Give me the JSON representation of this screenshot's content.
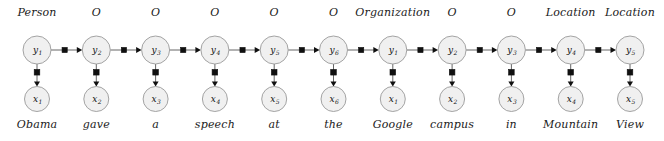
{
  "figure": {
    "type": "factor-graph-diagram",
    "colors": {
      "node_fill": "#f0f0f0",
      "node_stroke": "#9a9a9a",
      "edge": "#666666",
      "factor": "#101010",
      "text": "#1a1a1a",
      "background": "#ffffff"
    }
  },
  "layout": {
    "width": 664,
    "height": 141,
    "first_node_x": 37,
    "node_spacing": 59.3,
    "y_row_cy": 50,
    "x_row_cy": 99,
    "y_node_radius": 14,
    "x_node_radius": 12.5
  },
  "columns": [
    {
      "tag": "Person",
      "word": "Obama",
      "y_label": "y",
      "y_sub": "1",
      "x_label": "x",
      "x_sub": "1"
    },
    {
      "tag": "O",
      "word": "gave",
      "y_label": "y",
      "y_sub": "2",
      "x_label": "x",
      "x_sub": "2"
    },
    {
      "tag": "O",
      "word": "a",
      "y_label": "y",
      "y_sub": "3",
      "x_label": "x",
      "x_sub": "3"
    },
    {
      "tag": "O",
      "word": "speech",
      "y_label": "y",
      "y_sub": "4",
      "x_label": "x",
      "x_sub": "4"
    },
    {
      "tag": "O",
      "word": "at",
      "y_label": "y",
      "y_sub": "5",
      "x_label": "x",
      "x_sub": "5"
    },
    {
      "tag": "O",
      "word": "the",
      "y_label": "y",
      "y_sub": "6",
      "x_label": "x",
      "x_sub": "6"
    },
    {
      "tag": "Organization",
      "word": "Google",
      "y_label": "y",
      "y_sub": "1",
      "x_label": "x",
      "x_sub": "1"
    },
    {
      "tag": "O",
      "word": "campus",
      "y_label": "y",
      "y_sub": "2",
      "x_label": "x",
      "x_sub": "2"
    },
    {
      "tag": "O",
      "word": "in",
      "y_label": "y",
      "y_sub": "3",
      "x_label": "x",
      "x_sub": "3"
    },
    {
      "tag": "Location",
      "word": "Mountain",
      "y_label": "y",
      "y_sub": "4",
      "x_label": "x",
      "x_sub": "4"
    },
    {
      "tag": "Location",
      "word": "View",
      "y_label": "y",
      "y_sub": "5",
      "x_label": "x",
      "x_sub": "5"
    }
  ]
}
